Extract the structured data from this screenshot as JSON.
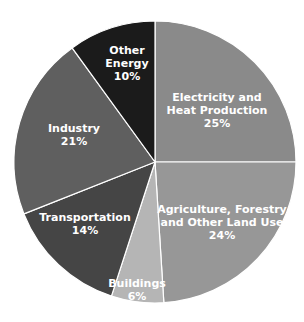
{
  "chart_data": {
    "type": "pie",
    "title": "",
    "start_angle_deg": 0,
    "direction": "clockwise",
    "legend": "none",
    "categories": [
      "Electricity and Heat Production",
      "Agriculture, Forestry and Other Land Use",
      "Buildings",
      "Transportation",
      "Industry",
      "Other Energy"
    ],
    "values": [
      25,
      24,
      6,
      14,
      21,
      10
    ],
    "unit": "%",
    "slices": [
      {
        "label": "Electricity and Heat Production",
        "value": 25,
        "pct_text": "25%",
        "color": "#8a8a8a"
      },
      {
        "label": "Agriculture, Forestry and Other Land Use",
        "value": 24,
        "pct_text": "24%",
        "color": "#979797"
      },
      {
        "label": "Buildings",
        "value": 6,
        "pct_text": "6%",
        "color": "#b5b5b5"
      },
      {
        "label": "Transportation",
        "value": 14,
        "pct_text": "14%",
        "color": "#454545"
      },
      {
        "label": "Industry",
        "value": 21,
        "pct_text": "21%",
        "color": "#5f5f5f"
      },
      {
        "label": "Other Energy",
        "value": 10,
        "pct_text": "10%",
        "color": "#1b1b1b"
      }
    ]
  },
  "labels": [
    {
      "lines": [
        "Electricity and",
        "Heat Production"
      ],
      "pct": "25%",
      "x": 217,
      "y": 110
    },
    {
      "lines": [
        "Agriculture, Forestry",
        "and Other Land Use"
      ],
      "pct": "24%",
      "x": 222,
      "y": 222
    },
    {
      "lines": [
        "Buildings"
      ],
      "pct": "6%",
      "x": 137,
      "y": 290
    },
    {
      "lines": [
        "Transportation"
      ],
      "pct": "14%",
      "x": 85,
      "y": 224
    },
    {
      "lines": [
        "Industry"
      ],
      "pct": "21%",
      "x": 74,
      "y": 135
    },
    {
      "lines": [
        "Other",
        "Energy"
      ],
      "pct": "10%",
      "x": 127,
      "y": 63
    }
  ]
}
